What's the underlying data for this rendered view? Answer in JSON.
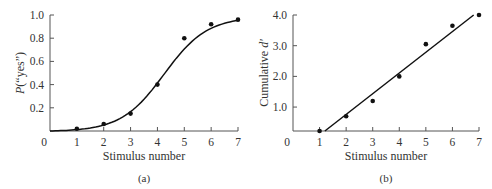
{
  "chart_data": [
    {
      "type": "scatter",
      "panel": "(a)",
      "title": "",
      "xlabel": "Stimulus number",
      "ylabel": "P(“yes”)",
      "xlim": [
        0,
        7
      ],
      "ylim": [
        0,
        1.0
      ],
      "x_ticks": [
        "0",
        "1",
        "2",
        "3",
        "4",
        "5",
        "6",
        "7"
      ],
      "y_ticks": [
        "0.2",
        "0.4",
        "0.6",
        "0.8",
        "1.0"
      ],
      "grid": false,
      "series": [
        {
          "name": "observed",
          "x": [
            1,
            2,
            3,
            4,
            5,
            6,
            7
          ],
          "values": [
            0.02,
            0.06,
            0.15,
            0.4,
            0.8,
            0.92,
            0.96
          ]
        },
        {
          "name": "fitted curve (sigmoid)",
          "x": [
            0,
            1,
            2,
            3,
            4,
            5,
            6,
            7
          ],
          "values": [
            0.0,
            0.02,
            0.07,
            0.2,
            0.43,
            0.7,
            0.88,
            0.96
          ]
        }
      ]
    },
    {
      "type": "scatter",
      "panel": "(b)",
      "title": "",
      "xlabel": "Stimulus number",
      "ylabel": "Cumulative d′",
      "xlim": [
        0,
        7
      ],
      "ylim": [
        0.2,
        4.0
      ],
      "x_ticks": [
        "0",
        "1",
        "2",
        "3",
        "4",
        "5",
        "6",
        "7"
      ],
      "y_ticks": [
        "1.0",
        "2.0",
        "3.0",
        "4.0"
      ],
      "grid": false,
      "series": [
        {
          "name": "observed",
          "x": [
            1,
            2,
            3,
            4,
            5,
            6,
            7
          ],
          "values": [
            0.2,
            0.7,
            1.2,
            2.0,
            3.05,
            3.65,
            4.0
          ]
        },
        {
          "name": "fitted line",
          "x": [
            1.2,
            6.8
          ],
          "values": [
            0.2,
            4.0
          ]
        }
      ]
    }
  ],
  "labels": {
    "a": {
      "xlabel": "Stimulus number",
      "ylabel_italic": "P",
      "ylabel_rest": "(“yes”)",
      "panel": "(a)",
      "origin": "0"
    },
    "b": {
      "xlabel": "Stimulus number",
      "ylabel_rest": "Cumulative ",
      "ylabel_italic": "d′",
      "panel": "(b)",
      "origin": "0"
    }
  }
}
